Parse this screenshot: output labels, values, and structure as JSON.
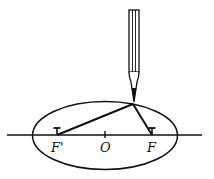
{
  "diagram": {
    "labels": {
      "left_focus": "F'",
      "center": "O",
      "right_focus": "F"
    },
    "colors": {
      "stroke": "#111111",
      "background": "#ffffff"
    }
  }
}
